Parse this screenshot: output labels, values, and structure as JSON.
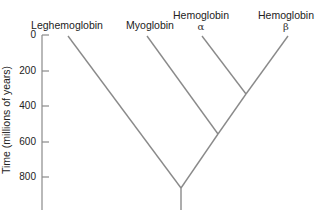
{
  "diagram": {
    "type": "phylogenetic-tree",
    "y_axis": {
      "label": "Time (millions of years)",
      "ticks": [
        "0",
        "200",
        "400",
        "600",
        "800"
      ]
    },
    "leaves": [
      {
        "name": "Leghemoglobin",
        "sub": ""
      },
      {
        "name": "Myoglobin",
        "sub": ""
      },
      {
        "name": "Hemoglobin",
        "sub": "α"
      },
      {
        "name": "Hemoglobin",
        "sub": "β"
      }
    ],
    "nodes": [
      {
        "joins": [
          "Hemoglobin α",
          "Hemoglobin β"
        ],
        "time_mya": 330
      },
      {
        "joins": [
          "Myoglobin",
          "Hemoglobins"
        ],
        "time_mya": 560
      },
      {
        "joins": [
          "Leghemoglobin",
          "Myoglobin + Hemoglobins"
        ],
        "time_mya": 860
      }
    ],
    "line_color": "#8a8a8a"
  }
}
